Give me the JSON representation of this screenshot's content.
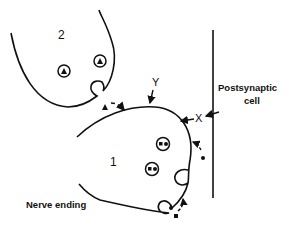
{
  "diagram": {
    "labels": {
      "terminal_2": "2",
      "terminal_1": "1",
      "site_y": "Y",
      "site_x": "X",
      "postsynaptic": "Postsynaptic",
      "postsynaptic_2": "cell",
      "nerve_ending": "Nerve ending"
    },
    "colors": {
      "stroke": "#111111",
      "background": "#ffffff"
    },
    "elements": {
      "terminal_2_vesicles": [
        {
          "symbol": "triangle"
        },
        {
          "symbol": "triangle"
        }
      ],
      "terminal_1_vesicles": [
        {
          "symbol": "double-square"
        },
        {
          "symbol": "double-square"
        }
      ],
      "exocytosis_sites": [
        "terminal-2-release",
        "terminal-1-right-release",
        "terminal-1-bottom-release"
      ],
      "released_particles": [
        "triangle",
        "dot",
        "square"
      ]
    }
  }
}
